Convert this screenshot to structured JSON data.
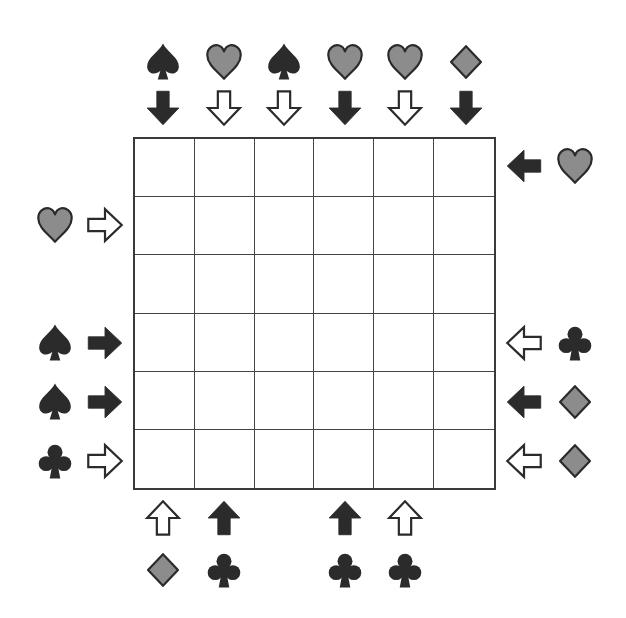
{
  "puzzle": {
    "type": "suit-arrow-grid",
    "rows": 6,
    "cols": 6,
    "colors": {
      "dark": "#2b2b2b",
      "gray": "#8c8c8c",
      "outline": "#2b2b2b",
      "grid": "#444444",
      "background": "#ffffff"
    },
    "top_clues": [
      {
        "col": 1,
        "suit": "spade",
        "suit_color": "dark",
        "arrow": "down",
        "arrow_style": "filled"
      },
      {
        "col": 2,
        "suit": "heart",
        "suit_color": "gray",
        "arrow": "down",
        "arrow_style": "hollow"
      },
      {
        "col": 3,
        "suit": "spade",
        "suit_color": "dark",
        "arrow": "down",
        "arrow_style": "hollow"
      },
      {
        "col": 4,
        "suit": "heart",
        "suit_color": "gray",
        "arrow": "down",
        "arrow_style": "filled"
      },
      {
        "col": 5,
        "suit": "heart",
        "suit_color": "gray",
        "arrow": "down",
        "arrow_style": "hollow"
      },
      {
        "col": 6,
        "suit": "diamond",
        "suit_color": "gray",
        "arrow": "down",
        "arrow_style": "filled"
      }
    ],
    "left_clues": [
      {
        "row": 2,
        "suit": "heart",
        "suit_color": "gray",
        "arrow": "right",
        "arrow_style": "hollow"
      },
      {
        "row": 4,
        "suit": "spade",
        "suit_color": "dark",
        "arrow": "right",
        "arrow_style": "filled"
      },
      {
        "row": 5,
        "suit": "spade",
        "suit_color": "dark",
        "arrow": "right",
        "arrow_style": "filled"
      },
      {
        "row": 6,
        "suit": "club",
        "suit_color": "dark",
        "arrow": "right",
        "arrow_style": "hollow"
      }
    ],
    "right_clues": [
      {
        "row": 1,
        "suit": "heart",
        "suit_color": "gray",
        "arrow": "left",
        "arrow_style": "filled"
      },
      {
        "row": 4,
        "suit": "club",
        "suit_color": "dark",
        "arrow": "left",
        "arrow_style": "hollow"
      },
      {
        "row": 5,
        "suit": "diamond",
        "suit_color": "gray",
        "arrow": "left",
        "arrow_style": "filled"
      },
      {
        "row": 6,
        "suit": "diamond",
        "suit_color": "gray",
        "arrow": "left",
        "arrow_style": "hollow"
      }
    ],
    "bottom_clues": [
      {
        "col": 1,
        "suit": "diamond",
        "suit_color": "gray",
        "arrow": "up",
        "arrow_style": "hollow"
      },
      {
        "col": 2,
        "suit": "club",
        "suit_color": "dark",
        "arrow": "up",
        "arrow_style": "filled"
      },
      {
        "col": 4,
        "suit": "club",
        "suit_color": "dark",
        "arrow": "up",
        "arrow_style": "filled"
      },
      {
        "col": 5,
        "suit": "club",
        "suit_color": "dark",
        "arrow": "up",
        "arrow_style": "hollow"
      }
    ],
    "cells": [
      [
        "",
        "",
        "",
        "",
        "",
        ""
      ],
      [
        "",
        "",
        "",
        "",
        "",
        ""
      ],
      [
        "",
        "",
        "",
        "",
        "",
        ""
      ],
      [
        "",
        "",
        "",
        "",
        "",
        ""
      ],
      [
        "",
        "",
        "",
        "",
        "",
        ""
      ],
      [
        "",
        "",
        "",
        "",
        "",
        ""
      ]
    ]
  }
}
